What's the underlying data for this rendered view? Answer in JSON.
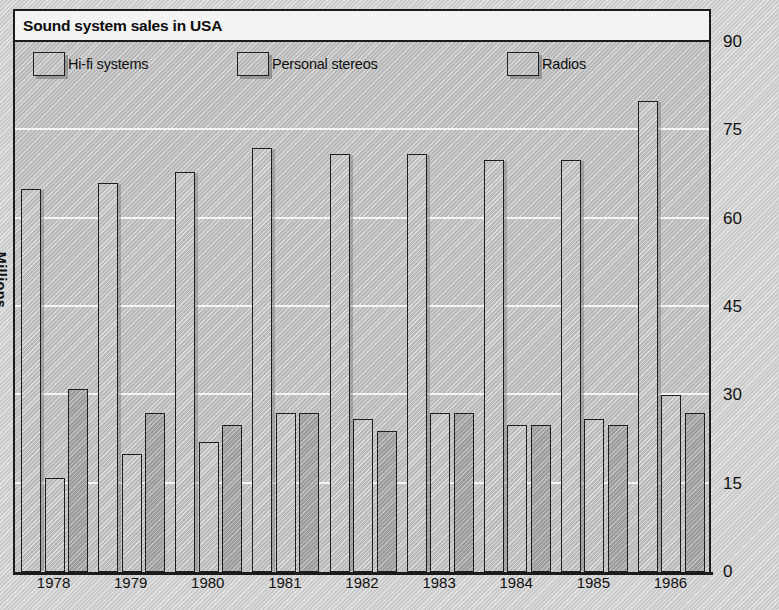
{
  "title": "Sound system sales in USA",
  "axis": {
    "y_label": "Millions",
    "y_ticks": [
      "0",
      "15",
      "30",
      "45",
      "60",
      "75",
      "90"
    ],
    "x_ticks": [
      "1978",
      "1979",
      "1980",
      "1981",
      "1982",
      "1983",
      "1984",
      "1985",
      "1986"
    ]
  },
  "legend": {
    "items": [
      {
        "label": "Hi-fi systems"
      },
      {
        "label": "Personal stereos"
      },
      {
        "label": "Radios"
      }
    ]
  },
  "colors": {
    "hifi": "#c6c6c6",
    "personal": "#c6c6c6",
    "radios": "#aeaeae",
    "outline": "#1d1d1d",
    "gridline": "#f4f4f4",
    "plot_background": "#c9c9c9",
    "title_background": "#f3f3f3"
  },
  "chart_data": {
    "type": "bar",
    "title": "Sound system sales in USA",
    "xlabel": "",
    "ylabel": "Millions",
    "ylim": [
      0,
      90
    ],
    "yticks": [
      0,
      15,
      30,
      45,
      60,
      75,
      90
    ],
    "grid": true,
    "legend_position": "top",
    "categories": [
      "1978",
      "1979",
      "1980",
      "1981",
      "1982",
      "1983",
      "1984",
      "1985",
      "1986"
    ],
    "series": [
      {
        "name": "Hi-fi systems",
        "values": [
          65,
          66,
          68,
          72,
          71,
          71,
          70,
          70,
          80
        ]
      },
      {
        "name": "Personal stereos",
        "values": [
          16,
          20,
          22,
          27,
          26,
          27,
          25,
          26,
          30
        ]
      },
      {
        "name": "Radios",
        "values": [
          31,
          27,
          25,
          27,
          24,
          27,
          25,
          25,
          27
        ]
      }
    ]
  }
}
